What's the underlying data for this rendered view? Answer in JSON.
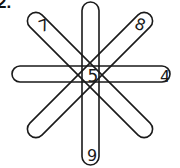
{
  "problem": {
    "label": "2."
  },
  "diagram": {
    "type": "magic-star-petals",
    "stroke_color": "#1a1a1a",
    "background": "#ffffff",
    "center": [
      90,
      75
    ],
    "petals": [
      {
        "name": "vertical",
        "angle": 90,
        "length": 163,
        "width": 17
      },
      {
        "name": "horizontal",
        "angle": 0,
        "length": 158,
        "width": 16
      },
      {
        "name": "diagonal-down",
        "angle": 45,
        "length": 170,
        "width": 17
      },
      {
        "name": "diagonal-up",
        "angle": -45,
        "length": 170,
        "width": 17
      }
    ],
    "numbers": {
      "upper_left": "7",
      "upper_right": "8",
      "right": "4",
      "bottom": "9",
      "center": "5"
    }
  }
}
